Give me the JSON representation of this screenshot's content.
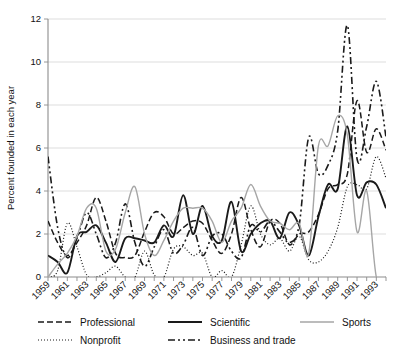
{
  "chart_data": {
    "type": "line",
    "title": "",
    "xlabel": "",
    "ylabel": "Percent founded in each year",
    "ylim": [
      0,
      12
    ],
    "yticks": [
      0,
      2,
      4,
      6,
      8,
      10,
      12
    ],
    "ytick_labels": [
      "0",
      "2",
      "4",
      "6",
      "8",
      "10",
      "12"
    ],
    "xlim": [
      1959,
      1994
    ],
    "grid": "horizontal",
    "legend_position": "bottom",
    "x": [
      1959,
      1960,
      1961,
      1962,
      1963,
      1964,
      1965,
      1966,
      1967,
      1968,
      1969,
      1970,
      1971,
      1972,
      1973,
      1974,
      1975,
      1976,
      1977,
      1978,
      1979,
      1980,
      1981,
      1982,
      1983,
      1984,
      1985,
      1986,
      1987,
      1988,
      1989,
      1990,
      1991,
      1992,
      1993,
      1994
    ],
    "xtick_labels": [
      "1959",
      "1961",
      "1963",
      "1965",
      "1967",
      "1969",
      "1971",
      "1973",
      "1975",
      "1977",
      "1979",
      "1981",
      "1983",
      "1985",
      "1987",
      "1989",
      "1991",
      "1993"
    ],
    "xtick_values": [
      1959,
      1961,
      1963,
      1965,
      1967,
      1969,
      1971,
      1973,
      1975,
      1977,
      1979,
      1981,
      1983,
      1985,
      1987,
      1989,
      1991,
      1993
    ],
    "series": [
      {
        "name": "Professional",
        "style": "dashed",
        "color": "#1a1a1a",
        "width": 1.5,
        "dash": "6,3",
        "values": [
          2.6,
          1.6,
          1.0,
          1.6,
          2.4,
          3.7,
          2.6,
          1.1,
          0.9,
          1.0,
          2.1,
          3.0,
          2.8,
          2.0,
          2.3,
          2.6,
          2.5,
          1.7,
          1.1,
          2.0,
          3.7,
          2.2,
          1.4,
          2.6,
          2.5,
          1.5,
          2.0,
          2.1,
          2.9,
          4.1,
          4.3,
          4.8,
          8.2,
          5.8,
          6.9,
          5.9
        ]
      },
      {
        "name": "Nonprofit",
        "style": "dotted",
        "color": "#1a1a1a",
        "width": 1.2,
        "dash": "1,2",
        "values": [
          0.0,
          0.3,
          2.5,
          1.4,
          0.1,
          0.0,
          0.2,
          0.5,
          0.0,
          0.0,
          1.2,
          0.1,
          0.0,
          1.3,
          1.4,
          1.0,
          1.1,
          0.0,
          0.3,
          0.0,
          1.5,
          3.3,
          2.0,
          1.5,
          1.8,
          1.2,
          1.9,
          0.8,
          0.7,
          1.2,
          2.3,
          4.2,
          4.3,
          4.1,
          5.6,
          4.6
        ]
      },
      {
        "name": "Scientific",
        "style": "solid",
        "color": "#1a1a1a",
        "width": 1.9,
        "dash": "",
        "values": [
          1.0,
          0.7,
          0.2,
          1.9,
          2.1,
          2.4,
          1.6,
          0.7,
          1.8,
          1.8,
          1.7,
          1.6,
          2.4,
          1.9,
          3.8,
          2.0,
          3.3,
          1.9,
          1.7,
          3.5,
          1.2,
          2.0,
          2.5,
          2.6,
          1.8,
          3.0,
          2.4,
          1.0,
          2.8,
          4.3,
          4.1,
          7.0,
          3.8,
          4.4,
          4.3,
          3.2
        ]
      },
      {
        "name": "Business and trade",
        "style": "dash-dot",
        "color": "#1a1a1a",
        "width": 1.6,
        "dash": "7,3,2,3,2,3",
        "values": [
          5.6,
          2.3,
          0.9,
          1.8,
          3.0,
          2.0,
          0.9,
          1.6,
          3.4,
          1.6,
          0.5,
          1.4,
          2.2,
          1.1,
          1.5,
          2.3,
          1.0,
          1.9,
          2.0,
          1.2,
          0.9,
          2.4,
          2.1,
          2.6,
          2.1,
          1.6,
          2.4,
          6.5,
          4.8,
          5.2,
          6.8,
          11.7,
          5.5,
          7.0,
          9.1,
          6.5
        ]
      },
      {
        "name": "Sports",
        "style": "solid",
        "color": "#a6a6a6",
        "width": 1.4,
        "dash": "",
        "values": [
          0.0,
          0.6,
          1.1,
          1.9,
          3.2,
          3.2,
          1.2,
          1.3,
          3.0,
          4.2,
          2.0,
          1.0,
          1.7,
          2.6,
          3.2,
          3.2,
          3.2,
          2.6,
          1.6,
          2.6,
          3.2,
          4.3,
          3.3,
          2.6,
          2.5,
          2.2,
          2.5,
          1.1,
          6.1,
          6.1,
          7.5,
          6.6,
          2.1,
          4.0,
          0.0,
          0.0
        ]
      }
    ]
  },
  "legend": {
    "entries": [
      {
        "label": "Professional",
        "series": 0
      },
      {
        "label": "Scientific",
        "series": 2
      },
      {
        "label": "Sports",
        "series": 4
      },
      {
        "label": "Nonprofit",
        "series": 1
      },
      {
        "label": "Business and trade",
        "series": 3
      }
    ]
  },
  "colors": {
    "background": "#ffffff",
    "grid": "#d9d9d9",
    "axis": "#8c8c8c",
    "ink": "#1a1a1a",
    "gray_series": "#a6a6a6"
  }
}
